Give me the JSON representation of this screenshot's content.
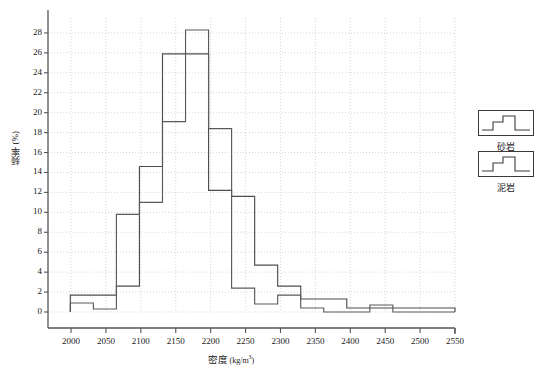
{
  "chart_data": {
    "type": "bar",
    "subtype": "step-histogram",
    "title": "",
    "xlabel": "密度 (kg/m³)",
    "xlabel_main": "密度",
    "xlabel_unit": "(kg/m³)",
    "ylabel": "频率 (%)",
    "xlim": [
      1967,
      2550
    ],
    "ylim": [
      0,
      29.5
    ],
    "grid": true,
    "grid_style": "dotted",
    "legend_position": "right-outside",
    "x_ticks": [
      2000,
      2050,
      2100,
      2150,
      2200,
      2250,
      2300,
      2350,
      2400,
      2450,
      2500,
      2550
    ],
    "x_tick_labels": [
      "2000",
      "2050",
      "2100",
      "2150",
      "2200",
      "2250",
      "2300",
      "2350",
      "2400",
      "2450",
      "2500",
      "2550"
    ],
    "y_ticks": [
      0,
      2,
      4,
      6,
      8,
      10,
      12,
      14,
      16,
      18,
      20,
      22,
      24,
      26,
      28
    ],
    "y_tick_labels": [
      "0",
      "2",
      "4",
      "6",
      "8",
      "10",
      "12",
      "14",
      "16",
      "18",
      "20",
      "22",
      "24",
      "26",
      "28"
    ],
    "bin_width": 33,
    "series": [
      {
        "name": "砂岩",
        "color": "#4d4d4d",
        "bin_edges": [
          1999,
          2032,
          2065,
          2098,
          2131,
          2164,
          2197,
          2230,
          2263,
          2296,
          2329,
          2362,
          2395,
          2428,
          2461,
          2494,
          2550
        ],
        "values": [
          1.7,
          1.7,
          2.6,
          14.6,
          25.9,
          25.9,
          12.2,
          11.6,
          4.7,
          2.6,
          1.3,
          1.3,
          0.4,
          0.4,
          0.4,
          0.4
        ]
      },
      {
        "name": "泥岩",
        "color": "#5a5a5a",
        "bin_edges": [
          1999,
          2032,
          2065,
          2098,
          2131,
          2164,
          2197,
          2230,
          2263,
          2296,
          2329,
          2362,
          2395,
          2428,
          2461,
          2494,
          2550
        ],
        "values": [
          0.9,
          0.3,
          9.8,
          11.0,
          19.1,
          28.3,
          18.4,
          2.4,
          0.8,
          1.7,
          0.4,
          0.0,
          0.0,
          0.7,
          0.0,
          0.0
        ]
      }
    ],
    "annotations": []
  },
  "legend": {
    "items": [
      {
        "label": "砂岩",
        "icon": "step-line-swatch"
      },
      {
        "label": "泥岩",
        "icon": "step-line-swatch"
      }
    ]
  }
}
